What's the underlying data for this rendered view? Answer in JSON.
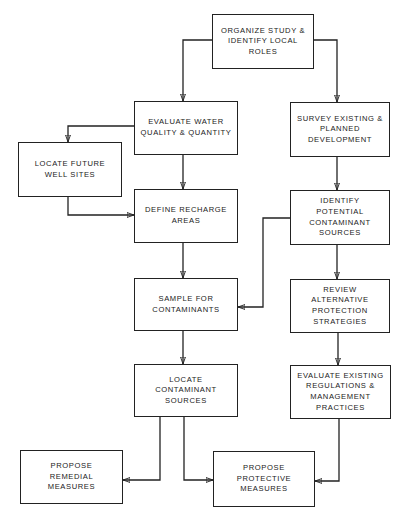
{
  "diagram": {
    "type": "flowchart",
    "nodes": [
      {
        "id": "organize",
        "label": "ORGANIZE STUDY &\nIDENTIFY LOCAL\nROLES",
        "x": 212,
        "y": 14,
        "w": 102,
        "h": 55
      },
      {
        "id": "evaluate_water",
        "label": "EVALUATE WATER\nQUALITY & QUANTITY",
        "x": 134,
        "y": 101,
        "w": 104,
        "h": 54
      },
      {
        "id": "survey",
        "label": "SURVEY EXISTING &\nPLANNED\nDEVELOPMENT",
        "x": 290,
        "y": 102,
        "w": 100,
        "h": 55
      },
      {
        "id": "locate_well",
        "label": "LOCATE FUTURE\nWELL SITES",
        "x": 18,
        "y": 142,
        "w": 104,
        "h": 55
      },
      {
        "id": "define_recharge",
        "label": "DEFINE RECHARGE\nAREAS",
        "x": 134,
        "y": 189,
        "w": 104,
        "h": 54
      },
      {
        "id": "identify_sources",
        "label": "IDENTIFY\nPOTENTIAL\nCONTAMINANT\nSOURCES",
        "x": 290,
        "y": 190,
        "w": 100,
        "h": 55
      },
      {
        "id": "sample",
        "label": "SAMPLE FOR\nCONTAMINANTS",
        "x": 134,
        "y": 278,
        "w": 104,
        "h": 53
      },
      {
        "id": "review",
        "label": "REVIEW\nALTERNATIVE\nPROTECTION\nSTRATEGIES",
        "x": 290,
        "y": 279,
        "w": 100,
        "h": 54
      },
      {
        "id": "locate_sources",
        "label": "LOCATE\nCONTAMINANT\nSOURCES",
        "x": 134,
        "y": 364,
        "w": 104,
        "h": 53
      },
      {
        "id": "evaluate_regs",
        "label": "EVALUATE EXISTING\nREGULATIONS &\nMANAGEMENT\nPRACTICES",
        "x": 290,
        "y": 365,
        "w": 101,
        "h": 54
      },
      {
        "id": "remedial",
        "label": "PROPOSE\nREMEDIAL\nMEASURES",
        "x": 20,
        "y": 450,
        "w": 103,
        "h": 54
      },
      {
        "id": "protective",
        "label": "PROPOSE\nPROTECTIVE\nMEASURES",
        "x": 213,
        "y": 451,
        "w": 102,
        "h": 56
      }
    ],
    "edges": [
      {
        "from": "organize",
        "to": "evaluate_water",
        "d": "M212,40 H183 V101"
      },
      {
        "from": "organize",
        "to": "survey",
        "d": "M314,40 H337 V102"
      },
      {
        "from": "evaluate_water",
        "to": "locate_well",
        "d": "M134,126 H68 V142"
      },
      {
        "from": "evaluate_water",
        "to": "define_recharge",
        "d": "M183,155 V189"
      },
      {
        "from": "locate_well",
        "to": "define_recharge",
        "d": "M68,197 V215 H134"
      },
      {
        "from": "survey",
        "to": "identify_sources",
        "d": "M337,157 V190"
      },
      {
        "from": "identify_sources",
        "to": "sample",
        "d": "M290,218 H263 V307 H238"
      },
      {
        "from": "define_recharge",
        "to": "sample",
        "d": "M183,243 V278"
      },
      {
        "from": "identify_sources",
        "to": "review",
        "d": "M337,245 V279"
      },
      {
        "from": "sample",
        "to": "locate_sources",
        "d": "M183,331 V364"
      },
      {
        "from": "review",
        "to": "evaluate_regs",
        "d": "M338,333 V365"
      },
      {
        "from": "locate_sources",
        "to": "remedial",
        "d": "M160,417 V480 H123"
      },
      {
        "from": "locate_sources",
        "to": "protective",
        "d": "M184,417 V480 H213"
      },
      {
        "from": "evaluate_regs",
        "to": "protective",
        "d": "M339,419 V481 H315"
      }
    ]
  }
}
